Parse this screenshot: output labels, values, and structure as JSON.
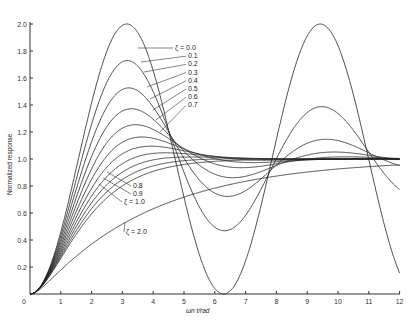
{
  "chart_data": {
    "type": "line",
    "title": "",
    "xlabel": "ωn t/rad",
    "ylabel": "Normalized response",
    "xlim": [
      0,
      12
    ],
    "ylim": [
      0,
      2.0
    ],
    "xticks": [
      "0",
      "1",
      "2",
      "3",
      "4",
      "5",
      "6",
      "7",
      "8",
      "9",
      "10",
      "11",
      "12"
    ],
    "yticks": [
      "0.2",
      "0.4",
      "0.6",
      "0.8",
      "1.0",
      "1.2",
      "1.4",
      "1.6",
      "1.8",
      "2.0"
    ],
    "grid": false,
    "legend": "inline annotations",
    "series": [
      {
        "name": "ζ = 0.0",
        "zeta": 0.0
      },
      {
        "name": "0.1",
        "zeta": 0.1
      },
      {
        "name": "0.2",
        "zeta": 0.2
      },
      {
        "name": "0.3",
        "zeta": 0.3
      },
      {
        "name": "0.4",
        "zeta": 0.4
      },
      {
        "name": "0.5",
        "zeta": 0.5
      },
      {
        "name": "0.6",
        "zeta": 0.6
      },
      {
        "name": "0.7",
        "zeta": 0.7
      },
      {
        "name": "0.8",
        "zeta": 0.8
      },
      {
        "name": "0.9",
        "zeta": 0.9
      },
      {
        "name": "ζ = 1.0",
        "zeta": 1.0
      },
      {
        "name": "ζ = 2.0",
        "zeta": 2.0
      }
    ],
    "annotations_upper": [
      "ζ = 0.0",
      "0.1",
      "0.2",
      "0.3",
      "0.4",
      "0.5",
      "0.6",
      "0.7"
    ],
    "annotations_lower": [
      "0.8",
      "0.9",
      "ζ = 1.0"
    ],
    "annotation_zeta2": "ζ = 2.0",
    "origin_label": "0"
  }
}
